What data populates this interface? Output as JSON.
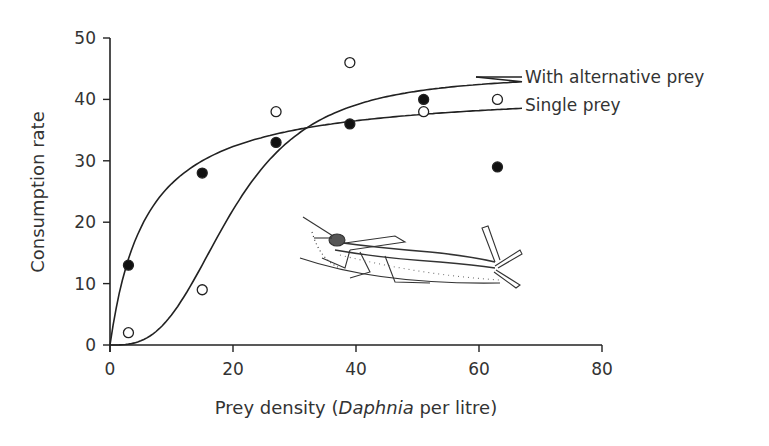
{
  "chart_data": {
    "type": "scatter",
    "title": "",
    "xlabel": "Prey density (Daphnia per litre)",
    "xlabel_parts": {
      "pre": "Prey density (",
      "italic": "Daphnia",
      "post": " per litre)"
    },
    "ylabel": "Consumption rate",
    "xlim": [
      0,
      80
    ],
    "ylim": [
      0,
      50
    ],
    "x_ticks": [
      "0",
      "20",
      "40",
      "60",
      "80"
    ],
    "y_ticks": [
      "0",
      "10",
      "20",
      "30",
      "40",
      "50"
    ],
    "grid": false,
    "legend_position": "right, inline curve labels",
    "series": [
      {
        "name": "Single prey",
        "marker": "filled-circle",
        "points": [
          [
            3,
            13
          ],
          [
            15,
            28
          ],
          [
            27,
            33
          ],
          [
            39,
            36
          ],
          [
            51,
            40
          ],
          [
            63,
            29
          ]
        ],
        "fit_curve": "type II (hyperbolic), asymptote ~38"
      },
      {
        "name": "With alternative prey",
        "marker": "open-circle",
        "points": [
          [
            3,
            2
          ],
          [
            15,
            9
          ],
          [
            27,
            38
          ],
          [
            39,
            46
          ],
          [
            51,
            38
          ],
          [
            63,
            40
          ]
        ],
        "fit_curve": "type III (sigmoid), asymptote ~44"
      }
    ],
    "annotations": [
      "Illustration of an aquatic insect predator (damselfly larva)"
    ]
  },
  "labels": {
    "with_alt": "With alternative prey",
    "single": "Single prey"
  }
}
